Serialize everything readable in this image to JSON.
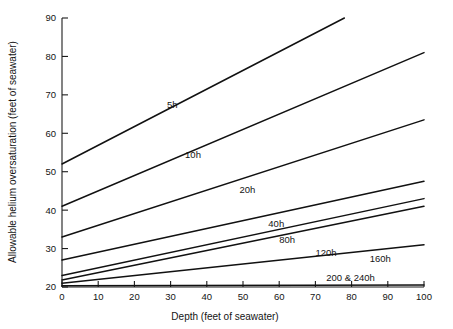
{
  "chart_data": {
    "type": "line",
    "title": "",
    "xlabel": "Depth  (feet of seawater)",
    "ylabel": "Allowable helium oversaturation  (feet of seawater)",
    "xlim": [
      0,
      100
    ],
    "ylim": [
      20,
      90
    ],
    "xticks": [
      0,
      10,
      20,
      30,
      40,
      50,
      60,
      70,
      80,
      90,
      100
    ],
    "yticks": [
      20,
      30,
      40,
      50,
      60,
      70,
      80,
      90
    ],
    "xticklabels": [
      "0",
      "10",
      "20",
      "30",
      "40",
      "50",
      "60",
      "70",
      "80",
      "90",
      "100"
    ],
    "yticklabels": [
      "20",
      "30",
      "40",
      "50",
      "60",
      "70",
      "80",
      "90"
    ],
    "grid": false,
    "legend_position": "inline-labels",
    "line_color": "#111111",
    "axis_color": "#1c1c1c",
    "background": "#ffffff",
    "series": [
      {
        "name": "5h",
        "label": "5h",
        "x": [
          0,
          78
        ],
        "values": [
          52,
          90
        ],
        "label_x": 29,
        "label_y": 66.5
      },
      {
        "name": "10h",
        "label": "10h",
        "x": [
          0,
          100
        ],
        "values": [
          41,
          81
        ],
        "label_x": 34,
        "label_y": 53.5
      },
      {
        "name": "20h",
        "label": "20h",
        "x": [
          0,
          100
        ],
        "values": [
          33,
          63.5
        ],
        "label_x": 49,
        "label_y": 44.5
      },
      {
        "name": "40h",
        "label": "40h",
        "x": [
          0,
          100
        ],
        "values": [
          27,
          47.5
        ],
        "label_x": 57,
        "label_y": 35.5
      },
      {
        "name": "80h",
        "label": "80h",
        "x": [
          0,
          100
        ],
        "values": [
          23,
          43
        ],
        "label_x": 60,
        "label_y": 31.5
      },
      {
        "name": "120h",
        "label": "120h",
        "x": [
          0,
          100
        ],
        "values": [
          21.8,
          41
        ],
        "label_x": 70,
        "label_y": 28.0
      },
      {
        "name": "160h",
        "label": "160h",
        "x": [
          0,
          100
        ],
        "values": [
          21.0,
          31
        ],
        "label_x": 85,
        "label_y": 26.5
      },
      {
        "name": "200 & 240h",
        "label": "200 & 240h",
        "x": [
          0,
          100
        ],
        "values": [
          20.3,
          20.5
        ],
        "label_x": 73,
        "label_y": 21.6
      }
    ]
  }
}
